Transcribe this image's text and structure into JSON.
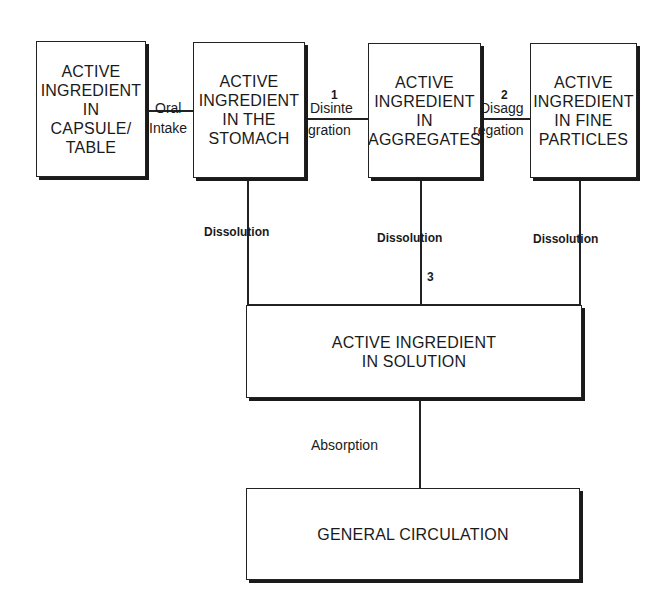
{
  "diagram": {
    "boxes": [
      {
        "id": "capsule",
        "label": "ACTIVE\nINGREDIENT\nIN\nCAPSULE/\nTABLE"
      },
      {
        "id": "stomach",
        "label": "ACTIVE\nINGREDIENT\nIN THE\nSTOMACH"
      },
      {
        "id": "aggregates",
        "label": "ACTIVE\nINGREDIENT\nIN\nAGGREGATES"
      },
      {
        "id": "fine-particles",
        "label": "ACTIVE\nINGREDIENT\nIN FINE\nPARTICLES"
      },
      {
        "id": "solution",
        "label": "ACTIVE INGREDIENT\nIN SOLUTION"
      },
      {
        "id": "circulation",
        "label": "GENERAL CIRCULATION"
      }
    ],
    "edges": {
      "oral_intake": {
        "top": "Oral",
        "bottom": "Intake"
      },
      "disintegration": {
        "number": "1",
        "top": "Disinte",
        "bottom": "gration"
      },
      "disaggregation": {
        "number": "2",
        "top": "Disagg",
        "bottom": "regation"
      },
      "dissolution_stomach": "Dissolution",
      "dissolution_aggregates": "Dissolution",
      "dissolution_aggregates_number": "3",
      "dissolution_fine": "Dissolution",
      "absorption": "Absorption"
    }
  }
}
